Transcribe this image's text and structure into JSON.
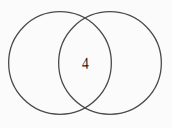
{
  "figure": {
    "type": "venn-diagram",
    "width": 172,
    "height": 128,
    "background_color": "#fbfbfb",
    "stroke_color": "#4a4a4a",
    "stroke_width": 1.3,
    "text_color": "#1d1d1d"
  },
  "chart_data": {
    "type": "venn",
    "title": "",
    "subtitle": "",
    "xlabel": "",
    "ylabel": "",
    "grid": false,
    "legend_position": "none",
    "sets": [
      {
        "name": "left-circle",
        "label": "",
        "cx": 60,
        "cy": 63,
        "r": 52,
        "value": ""
      },
      {
        "name": "right-circle",
        "label": "",
        "cx": 110,
        "cy": 63,
        "r": 52,
        "value": ""
      }
    ],
    "regions": [
      {
        "name": "left-only",
        "label": "",
        "value": ""
      },
      {
        "name": "intersection",
        "label": "4",
        "value": 4,
        "cx": 85,
        "cy": 63
      },
      {
        "name": "right-only",
        "label": "",
        "value": ""
      }
    ],
    "annotations": [
      {
        "name": "intersection-count",
        "text": "4",
        "x": 85,
        "y": 63
      }
    ]
  },
  "labels": {
    "intersection_value": "4"
  }
}
